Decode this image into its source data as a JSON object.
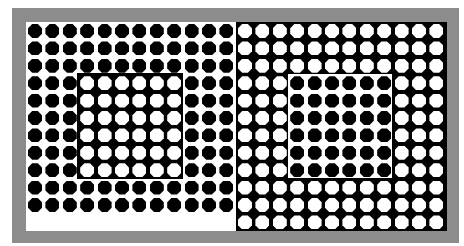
{
  "figure": {
    "colors": {
      "frame": "#8c8c8c",
      "black": "#000000",
      "white": "#ffffff"
    },
    "grid": {
      "pitch_px": 17.4,
      "dot_px": 14
    },
    "left_panel": {
      "background": "#ffffff",
      "dot_color": "#000000",
      "rows": 11,
      "cols": 12,
      "inner_block": {
        "row_start": 3,
        "col_start": 3,
        "rows": 6,
        "cols": 6,
        "background": "#000000",
        "dot_color": "#ffffff"
      }
    },
    "right_panel": {
      "background": "#000000",
      "dot_color": "#ffffff",
      "rows": 12,
      "cols": 12,
      "inner_block": {
        "row_start": 3,
        "col_start": 3,
        "rows": 6,
        "cols": 6,
        "background": "#ffffff",
        "dot_color": "#000000"
      }
    }
  }
}
